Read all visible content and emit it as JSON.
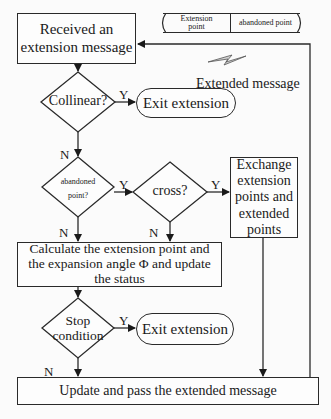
{
  "diagram": {
    "nodes": {
      "start": {
        "label": "Received an extension message"
      },
      "collinear": {
        "label": "Collinear?"
      },
      "exit1": {
        "label": "Exit extension"
      },
      "abandoned": {
        "label_line1": "abandoned",
        "label_line2": "point?"
      },
      "cross": {
        "label": "cross?"
      },
      "exchange": {
        "label": "Exchange extension points and extended points"
      },
      "calculate": {
        "label": "Calculate the extension point and the expansion angle Φ and update the status"
      },
      "stop": {
        "label_line1": "Stop",
        "label_line2": "condition"
      },
      "exit2": {
        "label": "Exit extension"
      },
      "update": {
        "label": "Update and pass the extended message"
      }
    },
    "message_format": {
      "field1_line1": "Extension",
      "field1_line2": "point",
      "field2": "abandoned point"
    },
    "extended_message_label": "Extended message",
    "edge_labels": {
      "collinear_yes": "Y",
      "collinear_no": "N",
      "abandoned_yes": "Y",
      "abandoned_no": "N",
      "cross_yes": "Y",
      "cross_no": "N",
      "stop_yes": "Y",
      "stop_no": "N"
    }
  }
}
